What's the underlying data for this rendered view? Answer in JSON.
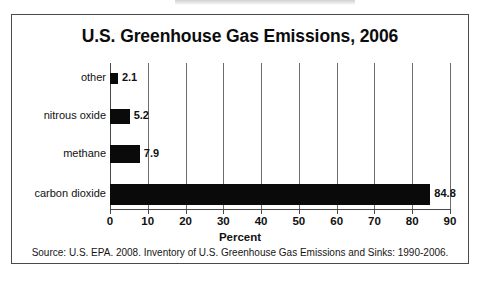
{
  "figure": {
    "title": "U.S. Greenhouse Gas Emissions, 2006",
    "x_axis_title": "Percent",
    "source_note": "Source:  U.S. EPA. 2008. Inventory of U.S. Greenhouse Gas Emissions and Sinks:  1990-2006."
  },
  "chart_data": {
    "type": "bar",
    "orientation": "horizontal",
    "title": "U.S. Greenhouse Gas Emissions, 2006",
    "xlabel": "Percent",
    "ylabel": "",
    "xlim": [
      0,
      90
    ],
    "xticks": [
      0,
      10,
      20,
      30,
      40,
      50,
      60,
      70,
      80,
      90
    ],
    "xtick_labels": [
      "0",
      "10",
      "20",
      "30",
      "40",
      "50",
      "60",
      "70",
      "80",
      "90"
    ],
    "grid": true,
    "grid_axis": "x",
    "legend": false,
    "bar_color": "#0a0a0a",
    "categories": [
      "other",
      "nitrous oxide",
      "methane",
      "carbon dioxide"
    ],
    "values": [
      2.1,
      5.2,
      7.9,
      84.8
    ],
    "data_labels": [
      "2.1",
      "5.2",
      "7.9",
      "84.8"
    ],
    "units": "percent",
    "annotations": [
      "Source:  U.S. EPA. 2008. Inventory of U.S. Greenhouse Gas Emissions and Sinks:  1990-2006."
    ]
  }
}
